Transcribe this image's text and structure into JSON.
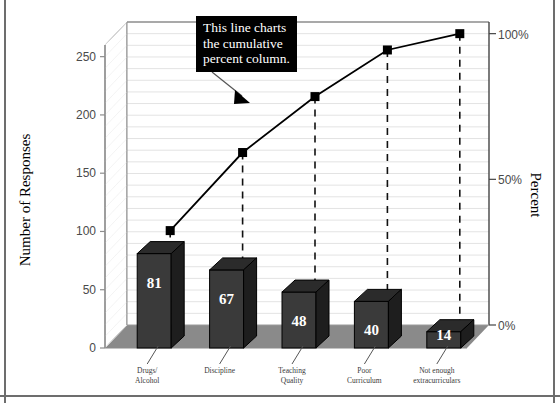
{
  "chart_data": {
    "type": "bar",
    "title": "",
    "xlabel": "",
    "ylabel": "Number of Responses",
    "y2label": "Percent",
    "categories": [
      "Drugs/\nAlcohol",
      "Discipline",
      "Teaching\nQuality",
      "Poor\nCurriculum",
      "Not enough\nextracurriculars"
    ],
    "category_lines": [
      [
        "Drugs/",
        "Alcohol"
      ],
      [
        "Discipline",
        ""
      ],
      [
        "Teaching",
        "Quality"
      ],
      [
        "Poor",
        "Curriculum"
      ],
      [
        "Not enough",
        "extracurriculars"
      ]
    ],
    "values": [
      81,
      67,
      48,
      40,
      14
    ],
    "bar_labels": [
      "81",
      "67",
      "48",
      "40",
      "14"
    ],
    "series": [
      {
        "name": "Number of Responses",
        "type": "bar",
        "values": [
          81,
          67,
          48,
          40,
          14
        ]
      },
      {
        "name": "Cumulative Percent",
        "type": "line",
        "values": [
          32.4,
          59.2,
          78.4,
          94.4,
          100.0
        ]
      }
    ],
    "cumulative_values": [
      81,
      148,
      196,
      236,
      250
    ],
    "ylim": [
      0,
      260
    ],
    "ylim2": [
      0,
      104
    ],
    "yticks": [
      0,
      50,
      100,
      150,
      200,
      250
    ],
    "ytick_labels": [
      "0",
      "50",
      "100",
      "150",
      "200",
      "250"
    ],
    "y2ticks": [
      0,
      50,
      100
    ],
    "y2tick_labels": [
      "0%",
      "50%",
      "100%"
    ],
    "grid": true,
    "legend": "none",
    "total": 250,
    "annotations": [
      {
        "name": "cumulative-percent-callout",
        "lines": [
          "This line charts",
          "the cumulative",
          "percent column."
        ],
        "text": "This line charts the cumulative percent column."
      }
    ],
    "colors": {
      "bar_front": "#3a3a3a",
      "bar_top": "#2b2b2b",
      "bar_side": "#1e1e1e",
      "floor": "#8a8a8a",
      "line": "#000000",
      "marker": "#000000",
      "grid": "#e3e3e3",
      "axis": "#8d8d8d",
      "callout_bg": "#000000",
      "callout_text": "#ffffff",
      "frame": "#6d6d6d"
    }
  }
}
